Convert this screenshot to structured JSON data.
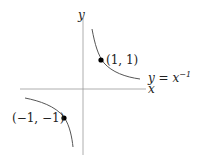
{
  "diagram": {
    "function_label": "y = x",
    "function_exponent": "−1",
    "axes": {
      "x_label": "x",
      "y_label": "y"
    },
    "points": [
      {
        "label": "(1, 1)",
        "x": 1,
        "y": 1
      },
      {
        "label": "(−1, −1)",
        "x": -1,
        "y": -1
      }
    ],
    "colors": {
      "axis": "#999999",
      "curve": "#555555",
      "point": "#000000",
      "text": "#222222"
    }
  }
}
